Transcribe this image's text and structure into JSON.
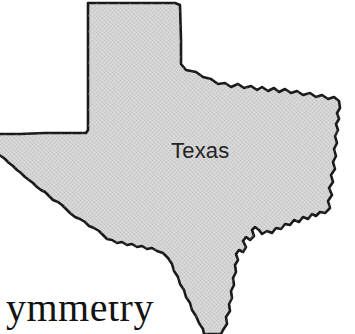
{
  "image": {
    "kind": "scanned-map-figure",
    "width": 355,
    "height": 334,
    "background_color": "#ffffff"
  },
  "map": {
    "title": "Texas",
    "region_label": "Texas",
    "fill_color": "#d2d2d2",
    "outline_color": "#1a1a1a",
    "outline_width": 2.6,
    "texture": "halftone-dither",
    "cropped_edges": [
      "left",
      "bottom"
    ],
    "features": {
      "panhandle": "north-west rectangular projection",
      "north_border": "straight line",
      "north_east_border": "jagged river boundary",
      "east_border": "stepped river boundary",
      "south_east_border": "gulf coastline",
      "south_west_border": "rio grande"
    }
  },
  "caption": {
    "visible_text": "ymmetry",
    "clipped": true,
    "font_style": "serif",
    "color": "#131313"
  }
}
